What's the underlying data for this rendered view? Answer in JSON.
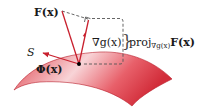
{
  "diagram": {
    "type": "vector projection onto surface normal",
    "surface": {
      "label": "S",
      "color_light": "#f7c4c8",
      "color_dark": "#d8323f"
    },
    "vectors": [
      {
        "name": "F",
        "label": "F(x)",
        "color": "#c8202e"
      },
      {
        "name": "grad_g",
        "label": "∇g(x)",
        "color": "#c8202e"
      },
      {
        "name": "Phi",
        "label": "Φ(x)",
        "color": "#c8202e"
      }
    ],
    "projection": {
      "label_prefix": "proj",
      "label_subscript": "∇g(x)",
      "label_suffix": "F(x)",
      "brace": "}"
    },
    "dashed_color": "#555555",
    "point_color": "#000000"
  }
}
